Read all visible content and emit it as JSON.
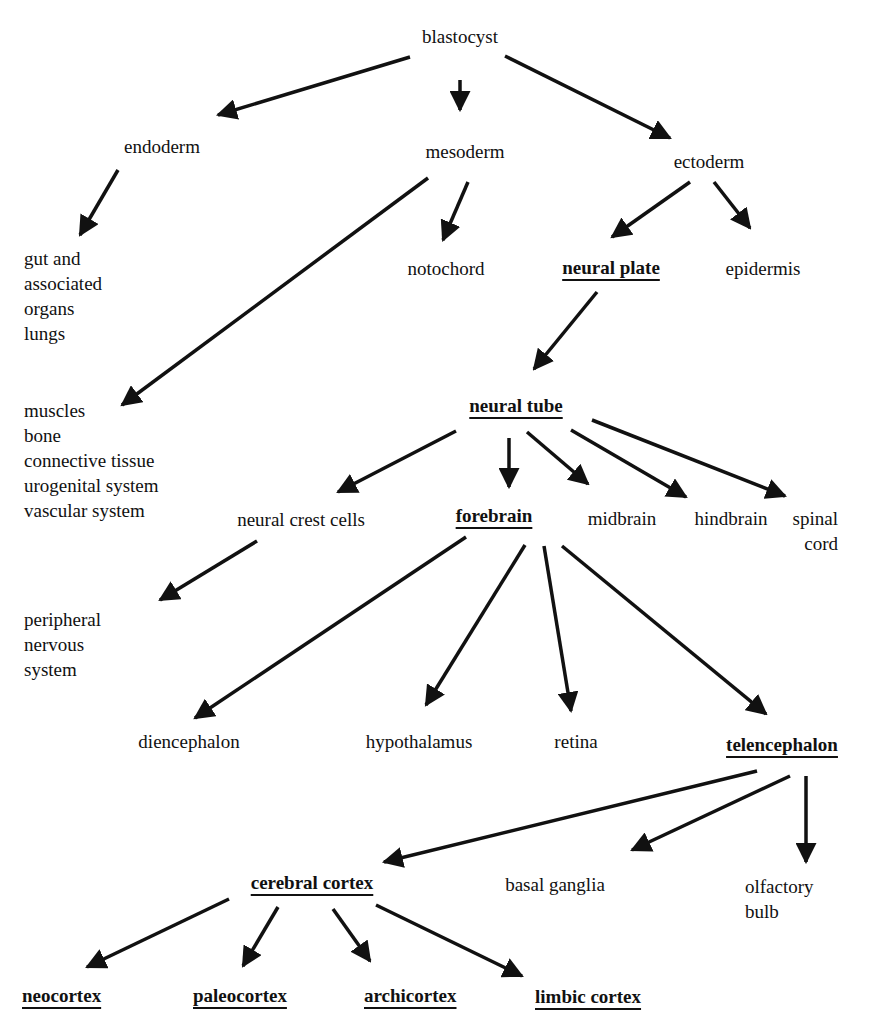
{
  "diagram": {
    "arrow_color": "#111111",
    "nodes": {
      "blastocyst": "blastocyst",
      "endoderm": "endoderm",
      "mesoderm": "mesoderm",
      "ectoderm": "ectoderm",
      "gut": "gut and\nassociated\norgans\nlungs",
      "notochord": "notochord",
      "neural_plate": "neural plate",
      "epidermis": "epidermis",
      "mesoderm_derivatives": "muscles\nbone\nconnective tissue\nurogenital system\nvascular system",
      "neural_tube": "neural tube",
      "neural_crest": "neural crest cells",
      "forebrain": "forebrain",
      "midbrain": "midbrain",
      "hindbrain": "hindbrain",
      "spinal_cord": "spinal\ncord",
      "pns": "peripheral\nnervous\nsystem",
      "diencephalon": "diencephalon",
      "hypothalamus": "hypothalamus",
      "retina": "retina",
      "telencephalon": "telencephalon",
      "cerebral_cortex": "cerebral cortex",
      "basal_ganglia": "basal ganglia",
      "olfactory_bulb": "olfactory\nbulb",
      "neocortex": "neocortex",
      "paleocortex": "paleocortex",
      "archicortex": "archicortex",
      "limbic_cortex": "limbic cortex"
    },
    "edges": [
      [
        "blastocyst",
        "endoderm"
      ],
      [
        "blastocyst",
        "mesoderm"
      ],
      [
        "blastocyst",
        "ectoderm"
      ],
      [
        "endoderm",
        "gut"
      ],
      [
        "mesoderm",
        "mesoderm_derivatives"
      ],
      [
        "mesoderm",
        "notochord"
      ],
      [
        "ectoderm",
        "neural_plate"
      ],
      [
        "ectoderm",
        "epidermis"
      ],
      [
        "neural_plate",
        "neural_tube"
      ],
      [
        "neural_tube",
        "neural_crest"
      ],
      [
        "neural_tube",
        "forebrain"
      ],
      [
        "neural_tube",
        "midbrain"
      ],
      [
        "neural_tube",
        "hindbrain"
      ],
      [
        "neural_tube",
        "spinal_cord"
      ],
      [
        "neural_crest",
        "pns"
      ],
      [
        "forebrain",
        "diencephalon"
      ],
      [
        "forebrain",
        "hypothalamus"
      ],
      [
        "forebrain",
        "retina"
      ],
      [
        "forebrain",
        "telencephalon"
      ],
      [
        "telencephalon",
        "cerebral_cortex"
      ],
      [
        "telencephalon",
        "basal_ganglia"
      ],
      [
        "telencephalon",
        "olfactory_bulb"
      ],
      [
        "cerebral_cortex",
        "neocortex"
      ],
      [
        "cerebral_cortex",
        "paleocortex"
      ],
      [
        "cerebral_cortex",
        "archicortex"
      ],
      [
        "cerebral_cortex",
        "limbic_cortex"
      ]
    ]
  }
}
